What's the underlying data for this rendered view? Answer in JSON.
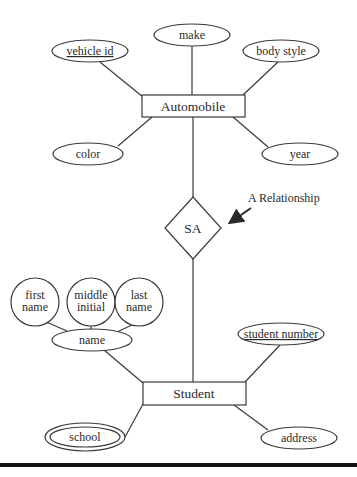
{
  "diagram": {
    "type": "entity-relationship",
    "entities": [
      {
        "id": "automobile",
        "label": "Automobile"
      },
      {
        "id": "student",
        "label": "Student"
      }
    ],
    "relationships": [
      {
        "id": "sa",
        "label": "SA",
        "connects": [
          "automobile",
          "student"
        ]
      }
    ],
    "attributes": {
      "vehicle_id": {
        "label": "vehicle id",
        "entity": "automobile",
        "key": true
      },
      "make": {
        "label": "make",
        "entity": "automobile"
      },
      "body_style": {
        "label": "body style",
        "entity": "automobile"
      },
      "color": {
        "label": "color",
        "entity": "automobile"
      },
      "year": {
        "label": "year",
        "entity": "automobile"
      },
      "name": {
        "label": "name",
        "entity": "student",
        "composite": true
      },
      "first_name": {
        "line1": "first",
        "line2": "name",
        "parent": "name"
      },
      "middle_initial": {
        "line1": "middle",
        "line2": "initial",
        "parent": "name"
      },
      "last_name": {
        "line1": "last",
        "line2": "name",
        "parent": "name"
      },
      "student_number": {
        "label": "student number",
        "entity": "student",
        "key": true
      },
      "school": {
        "label": "school",
        "entity": "student",
        "multivalued": true
      },
      "address": {
        "label": "address",
        "entity": "student"
      }
    },
    "annotation": {
      "label": "A Relationship",
      "points_to": "sa"
    }
  },
  "colors": {
    "stroke": "#3a3a3a",
    "text": "#2a2a2a",
    "background": "#ffffff",
    "bottom_rule": "#111111"
  }
}
